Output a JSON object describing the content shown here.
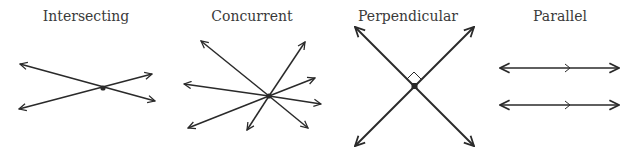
{
  "panels": [
    {
      "id": "intersecting",
      "label": "Intersecting",
      "label_x": 86
    },
    {
      "id": "concurrent",
      "label": "Concurrent",
      "label_x": 252
    },
    {
      "id": "perpendicular",
      "label": "Perpendicular",
      "label_x": 408
    },
    {
      "id": "parallel",
      "label": "Parallel",
      "label_x": 560
    }
  ],
  "colors": {
    "line": "#2a2a2a",
    "text": "#3a3a3a",
    "background": "#ffffff"
  }
}
